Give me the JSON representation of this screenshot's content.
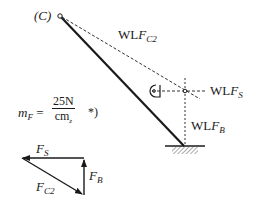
{
  "diagram": {
    "point_c_label": "(C)",
    "labels": {
      "wl_fc2_prefix": "WL",
      "wl_fc2_var": "F",
      "wl_fc2_sub": "C2",
      "wl_fs_prefix": "WL",
      "wl_fs_var": "F",
      "wl_fs_sub": "S",
      "wl_fb_prefix": "WL",
      "wl_fb_var": "F",
      "wl_fb_sub": "B"
    },
    "scale": {
      "lhs_var": "m",
      "lhs_sub": "F",
      "equals": "=",
      "numerator": "25N",
      "denominator": "cm",
      "denominator_sub": "z",
      "note": "*)"
    },
    "force_triangle": {
      "fs_var": "F",
      "fs_sub": "S",
      "fb_var": "F",
      "fb_sub": "B",
      "fc2_var": "F",
      "fc2_sub": "C2"
    }
  }
}
